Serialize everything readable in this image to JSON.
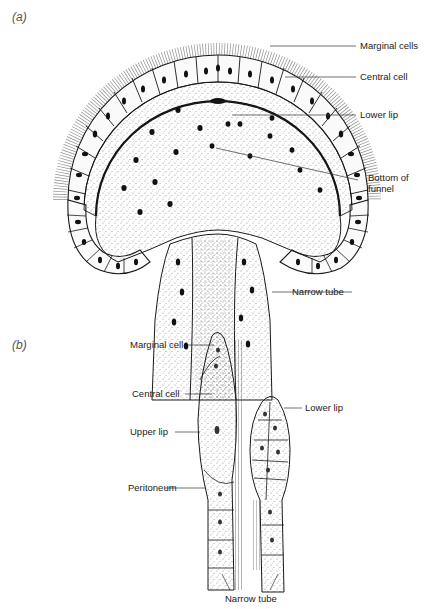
{
  "panels": [
    {
      "id": "a",
      "label": "(a)",
      "annotations": {
        "marginal_cells": "Marginal cells",
        "central_cell": "Central cell",
        "lower_lip": "Lower lip",
        "bottom_of_funnel_line1": "Bottom of",
        "bottom_of_funnel_line2": "funnel",
        "narrow_tube": "Narrow tube"
      }
    },
    {
      "id": "b",
      "label": "(b)",
      "annotations": {
        "marginal_cell": "Marginal cell",
        "central_cell": "Central cell",
        "upper_lip": "Upper lip",
        "peritoneum": "Peritoneum",
        "lower_lip": "Lower lip",
        "narrow_tube": "Narrow tube"
      }
    }
  ],
  "colors": {
    "ink": "#1a1a1a",
    "label_text": "#222222",
    "panel_label": "#555555",
    "background": "#ffffff"
  }
}
